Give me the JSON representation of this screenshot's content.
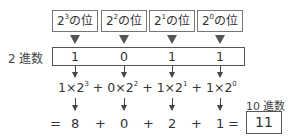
{
  "headers": [
    {
      "base": "2",
      "exp": "3",
      "suffix": "の位"
    },
    {
      "base": "2",
      "exp": "2",
      "suffix": "の位"
    },
    {
      "base": "2",
      "exp": "1",
      "suffix": "の位"
    },
    {
      "base": "2",
      "exp": "0",
      "suffix": "の位"
    }
  ],
  "binary": {
    "label": "2 進数",
    "digits": [
      "1",
      "0",
      "1",
      "1"
    ]
  },
  "formula": {
    "terms": [
      {
        "coef": "1",
        "times": "×",
        "base": "2",
        "exp": "3"
      },
      {
        "coef": "0",
        "times": "×",
        "base": "2",
        "exp": "2"
      },
      {
        "coef": "1",
        "times": "×",
        "base": "2",
        "exp": "1"
      },
      {
        "coef": "1",
        "times": "×",
        "base": "2",
        "exp": "0"
      }
    ],
    "plus": "+"
  },
  "result": {
    "equals": "=",
    "values": [
      "8",
      "0",
      "2",
      "1"
    ],
    "plus": "+",
    "decimal_label": "10 進数",
    "decimal_value": "11"
  }
}
